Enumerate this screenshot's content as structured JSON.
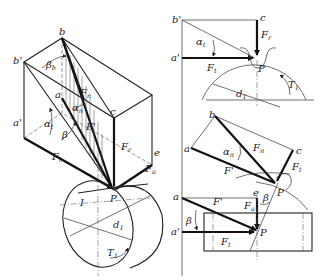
{
  "diagram": {
    "colors": {
      "line": "#222222",
      "background": "#ffffff"
    },
    "isometric_view": {
      "labels": {
        "b": "b",
        "b_prime": "b'",
        "a": "a",
        "a_prime": "a'",
        "c": "c",
        "e": "e",
        "P": "P",
        "I": "I",
        "beta_b": "β",
        "beta_b_sub": "b",
        "alpha_t": "α",
        "alpha_t_sub": "t",
        "alpha_n": "α",
        "alpha_n_sub": "n",
        "beta": "β",
        "F_n": "F",
        "F_n_sub": "n",
        "F_prime": "F'",
        "F_t": "F",
        "F_t_sub": "t",
        "F_r": "F",
        "F_r_sub": "r",
        "F_a": "F",
        "F_a_sub": "a",
        "d_1": "d",
        "d_1_sub": "1",
        "T_1": "T",
        "T_1_sub": "1"
      }
    },
    "transverse_view": {
      "labels": {
        "b_prime": "b'",
        "c": "c",
        "a_prime": "a'",
        "alpha_t": "α",
        "alpha_t_sub": "t",
        "F_r": "F",
        "F_r_sub": "r",
        "F_t": "F",
        "F_t_sub": "t",
        "P": "P",
        "d_1": "d",
        "d_1_sub": "1",
        "T_1": "T",
        "T_1_sub": "1"
      }
    },
    "normal_view": {
      "labels": {
        "b": "b",
        "a": "a",
        "c": "c",
        "alpha_n": "α",
        "alpha_n_sub": "n",
        "F_n": "F",
        "F_n_sub": "n",
        "F_prime": "F'",
        "F_t": "F",
        "F_t_sub": "t",
        "P": "P"
      }
    },
    "top_view": {
      "labels": {
        "a": "a",
        "a_prime": "a'",
        "e": "e",
        "beta_top": "β",
        "beta_left": "β",
        "F_prime": "F'",
        "F_a": "F",
        "F_a_sub": "a",
        "F_t": "F",
        "F_t_sub": "t",
        "P": "P"
      }
    }
  }
}
